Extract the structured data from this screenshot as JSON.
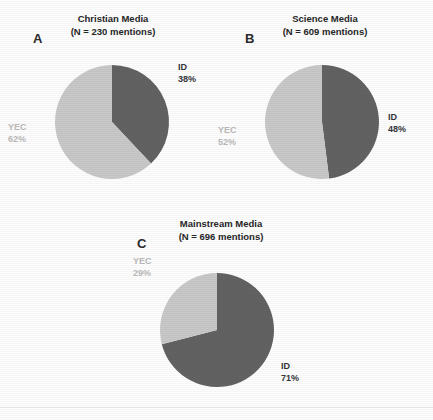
{
  "figure": {
    "width": 433,
    "height": 420,
    "background_color": "#fdfdfd",
    "baseline_rule_y": 407
  },
  "colors": {
    "id_slice": "#626262",
    "yec_slice": "#c8c8c8",
    "id_label_text": "#33363a",
    "yec_label_text": "#b9b9b9",
    "title_text": "#272727",
    "letter_text": "#2b2b2b"
  },
  "panels": [
    {
      "letter": "A",
      "title": "Christian Media",
      "subtitle": "(N = 230 mentions)",
      "center_x": 112,
      "center_y": 122,
      "radius": 57,
      "id_label": "ID",
      "id_pct_label": "38%",
      "yec_label": "YEC",
      "yec_pct_label": "62%",
      "id_label_x": 178,
      "id_label_y": 62,
      "yec_label_x": 8,
      "yec_label_y": 122
    },
    {
      "letter": "B",
      "title": "Science Media",
      "subtitle": "(N = 609 mentions)",
      "center_x": 322,
      "center_y": 122,
      "radius": 57,
      "id_label": "ID",
      "id_pct_label": "48%",
      "yec_label": "YEC",
      "yec_pct_label": "52%",
      "id_label_x": 388,
      "id_label_y": 112,
      "yec_label_x": 218,
      "yec_label_y": 125
    },
    {
      "letter": "C",
      "title": "Mainstream Media",
      "subtitle": "(N = 696 mentions)",
      "center_x": 217,
      "center_y": 330,
      "radius": 57,
      "id_label": "ID",
      "id_pct_label": "71%",
      "yec_label": "YEC",
      "yec_pct_label": "29%",
      "id_label_x": 281,
      "id_label_y": 361,
      "yec_label_x": 133,
      "yec_label_y": 256
    }
  ],
  "chart_data": {
    "type": "pie",
    "legend": [
      "ID",
      "YEC"
    ],
    "legend_position": "inline-annotations",
    "charts": [
      {
        "panel": "A",
        "title": "Christian Media",
        "subtitle": "(N = 230 mentions)",
        "n": 230,
        "labels": [
          "ID",
          "YEC"
        ],
        "values": [
          38,
          62
        ],
        "value_unit": "percent",
        "colors": [
          "#626262",
          "#c8c8c8"
        ],
        "start_angle_deg": 0,
        "direction": "clockwise"
      },
      {
        "panel": "B",
        "title": "Science Media",
        "subtitle": "(N = 609 mentions)",
        "n": 609,
        "labels": [
          "ID",
          "YEC"
        ],
        "values": [
          48,
          52
        ],
        "value_unit": "percent",
        "colors": [
          "#626262",
          "#c8c8c8"
        ],
        "start_angle_deg": 0,
        "direction": "clockwise"
      },
      {
        "panel": "C",
        "title": "Mainstream Media",
        "subtitle": "(N = 696 mentions)",
        "n": 696,
        "labels": [
          "ID",
          "YEC"
        ],
        "values": [
          71,
          29
        ],
        "value_unit": "percent",
        "colors": [
          "#626262",
          "#c8c8c8"
        ],
        "start_angle_deg": 0,
        "direction": "clockwise"
      }
    ]
  }
}
